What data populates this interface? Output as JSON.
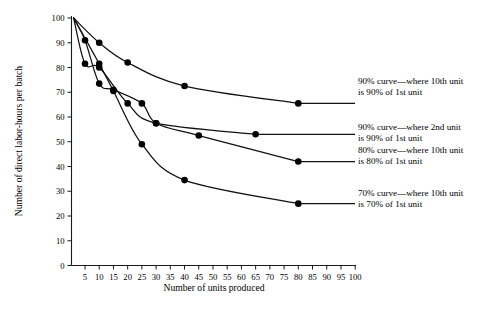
{
  "chart_data": {
    "type": "line",
    "title": "",
    "xlabel": "Number of units produced",
    "ylabel": "Number of direct labor-hours per batch",
    "xlim": [
      0,
      103
    ],
    "ylim": [
      0,
      100
    ],
    "grid": false,
    "legend_position": "right-inline-annotations",
    "x_ticks": [
      5,
      10,
      15,
      20,
      25,
      30,
      35,
      40,
      45,
      50,
      55,
      60,
      65,
      70,
      75,
      80,
      85,
      90,
      95,
      100
    ],
    "y_ticks": [
      0,
      10,
      20,
      30,
      40,
      50,
      60,
      70,
      80,
      90,
      100
    ],
    "series": [
      {
        "name": "90% curve-10th-unit",
        "label_line1": "90% curve—where 10th unit",
        "label_line2": "is 90% of 1st unit",
        "x": [
          1,
          10,
          20,
          40,
          80
        ],
        "y": [
          100,
          90,
          82,
          72.5,
          65.5
        ],
        "markers_x": [
          10,
          20,
          40,
          80
        ],
        "markers_y": [
          90,
          82,
          72.5,
          65.5
        ]
      },
      {
        "name": "90% curve-2nd-unit",
        "label_line1": "90% curve—where 2nd unit",
        "label_line2": "is 90% of 1st unit",
        "x": [
          1,
          5,
          10,
          20,
          30,
          65
        ],
        "y": [
          100,
          81.5,
          80,
          65.5,
          57.5,
          53
        ],
        "markers_x": [
          5,
          10,
          20,
          30,
          65
        ],
        "markers_y": [
          81.5,
          80,
          65.5,
          57.5,
          53
        ]
      },
      {
        "name": "80% curve-10th-unit",
        "label_line1": "80% curve—where 10th unit",
        "label_line2": "is 80% of 1st unit",
        "x": [
          1,
          5,
          10,
          15,
          25,
          30,
          45,
          80
        ],
        "y": [
          100,
          91,
          73.5,
          71,
          65.5,
          57.5,
          52.5,
          42
        ],
        "markers_x": [
          5,
          10,
          15,
          25,
          30,
          45,
          80
        ],
        "markers_y": [
          91,
          73.5,
          71,
          65.5,
          57.5,
          52.5,
          42
        ]
      },
      {
        "name": "70% curve-10th-unit",
        "label_line1": "70% curve—where 10th unit",
        "label_line2": "is 70% of 1st unit",
        "x": [
          1,
          10,
          15,
          25,
          40,
          80
        ],
        "y": [
          100,
          81.5,
          70.5,
          49,
          34.5,
          25
        ],
        "markers_x": [
          10,
          15,
          25,
          40,
          80
        ],
        "markers_y": [
          81.5,
          70.5,
          49,
          34.5,
          25
        ]
      }
    ],
    "annotations": [
      {
        "line1": "90% curve—where 10th unit",
        "line2": "is 90% of 1st unit"
      },
      {
        "line1": "90% curve—where 2nd unit",
        "line2": "is 90% of 1st unit"
      },
      {
        "line1": "80% curve—where 10th unit",
        "line2": "is 80% of 1st unit"
      },
      {
        "line1": "70% curve—where 10th unit",
        "line2": "is 70% of 1st unit"
      }
    ],
    "colors": {
      "curve": "#111111",
      "axis": "#1a1a1a",
      "marker": "#000000",
      "background": "#ffffff"
    }
  }
}
